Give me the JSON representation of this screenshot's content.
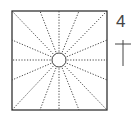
{
  "diagram": {
    "label": "4",
    "square": {
      "x": 12,
      "y": 11,
      "size": 96
    },
    "circle": {
      "cx": 59,
      "cy": 60,
      "r": 7
    },
    "ray_count": 16,
    "colors": {
      "stroke": "#333333",
      "background": "#ffffff"
    }
  }
}
